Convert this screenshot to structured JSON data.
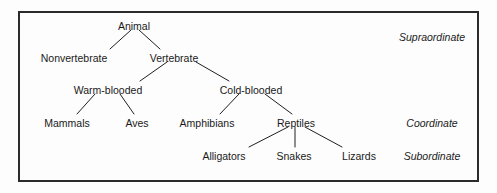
{
  "figure": {
    "frame": {
      "x": 18,
      "y": 11,
      "width": 461,
      "height": 171,
      "border_color": "#2b2b2b"
    },
    "background_color": "#fdfdfd",
    "text_color": "#1a1a1a",
    "line_color": "#1f1f1f"
  },
  "chart_data": {
    "type": "diagram",
    "subtype": "tree-hierarchy",
    "levels": [
      "Supraordinate",
      "Coordinate",
      "Subordinate"
    ],
    "nodes": [
      {
        "id": "animal",
        "label": "Animal",
        "x": 134,
        "y": 26,
        "level": 0
      },
      {
        "id": "nonvertebrate",
        "label": "Nonvertebrate",
        "x": 74,
        "y": 58,
        "level": 1
      },
      {
        "id": "vertebrate",
        "label": "Vertebrate",
        "x": 174,
        "y": 58,
        "level": 1
      },
      {
        "id": "warm_blooded",
        "label": "Warm-blooded",
        "x": 108,
        "y": 90,
        "level": 2
      },
      {
        "id": "cold_blooded",
        "label": "Cold-blooded",
        "x": 251,
        "y": 90,
        "level": 2
      },
      {
        "id": "mammals",
        "label": "Mammals",
        "x": 67,
        "y": 123,
        "level": 3
      },
      {
        "id": "aves",
        "label": "Aves",
        "x": 137,
        "y": 123,
        "level": 3
      },
      {
        "id": "amphibians",
        "label": "Amphibians",
        "x": 207,
        "y": 123,
        "level": 3
      },
      {
        "id": "reptiles",
        "label": "Reptiles",
        "x": 296,
        "y": 123,
        "level": 3
      },
      {
        "id": "alligators",
        "label": "Alligators",
        "x": 224,
        "y": 156,
        "level": 4
      },
      {
        "id": "snakes",
        "label": "Snakes",
        "x": 294,
        "y": 156,
        "level": 4
      },
      {
        "id": "lizards",
        "label": "Lizards",
        "x": 359,
        "y": 156,
        "level": 4
      }
    ],
    "edges": [
      {
        "from": "animal",
        "to": "nonvertebrate",
        "x1": 131,
        "y1": 30,
        "x2": 110,
        "y2": 49
      },
      {
        "from": "animal",
        "to": "vertebrate",
        "x1": 139,
        "y1": 30,
        "x2": 160,
        "y2": 49
      },
      {
        "from": "vertebrate",
        "to": "warm_blooded",
        "x1": 167,
        "y1": 62,
        "x2": 140,
        "y2": 81
      },
      {
        "from": "vertebrate",
        "to": "cold_blooded",
        "x1": 196,
        "y1": 62,
        "x2": 229,
        "y2": 81
      },
      {
        "from": "warm_blooded",
        "to": "mammals",
        "x1": 95,
        "y1": 94,
        "x2": 77,
        "y2": 114
      },
      {
        "from": "warm_blooded",
        "to": "aves",
        "x1": 120,
        "y1": 94,
        "x2": 134,
        "y2": 114
      },
      {
        "from": "cold_blooded",
        "to": "amphibians",
        "x1": 239,
        "y1": 94,
        "x2": 220,
        "y2": 114
      },
      {
        "from": "cold_blooded",
        "to": "reptiles",
        "x1": 265,
        "y1": 94,
        "x2": 292,
        "y2": 114
      },
      {
        "from": "reptiles",
        "to": "alligators",
        "x1": 288,
        "y1": 127,
        "x2": 249,
        "y2": 147
      },
      {
        "from": "reptiles",
        "to": "snakes",
        "x1": 295,
        "y1": 127,
        "x2": 295,
        "y2": 147
      },
      {
        "from": "reptiles",
        "to": "lizards",
        "x1": 305,
        "y1": 127,
        "x2": 342,
        "y2": 147
      }
    ],
    "level_labels": [
      {
        "id": "supraordinate",
        "label": "Supraordinate",
        "x": 432,
        "y": 37
      },
      {
        "id": "coordinate",
        "label": "Coordinate",
        "x": 432,
        "y": 123
      },
      {
        "id": "subordinate",
        "label": "Subordinate",
        "x": 432,
        "y": 156
      }
    ]
  }
}
